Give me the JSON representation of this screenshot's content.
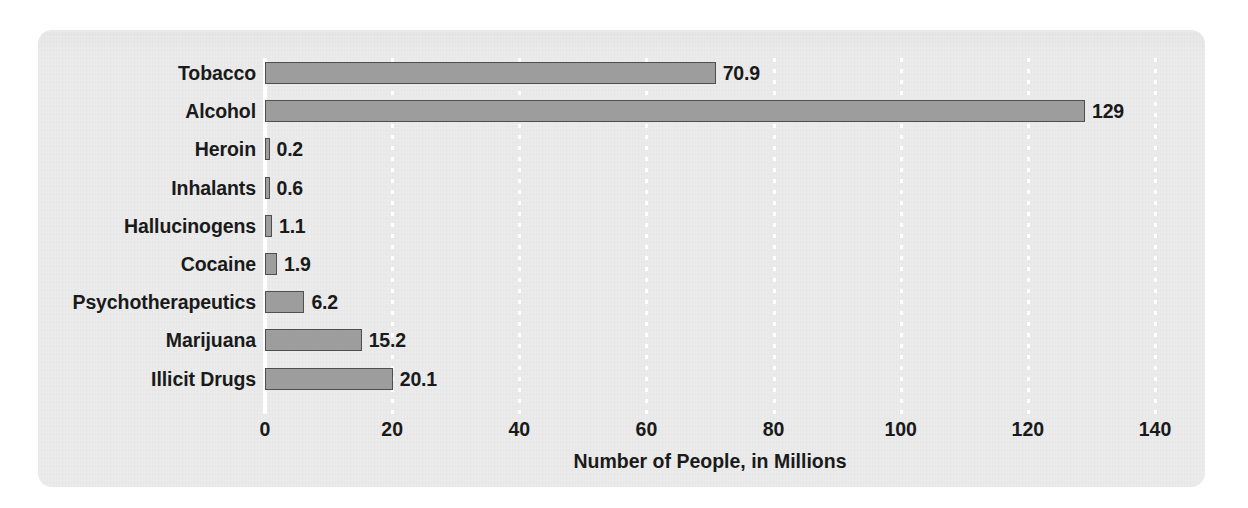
{
  "chart_data": {
    "type": "bar",
    "orientation": "horizontal",
    "title": "",
    "xlabel": "Number of People, in Millions",
    "ylabel": "",
    "xlim": [
      0,
      140
    ],
    "xticks": [
      0,
      20,
      40,
      60,
      80,
      100,
      120,
      140
    ],
    "grid": "vertical-dotted-white",
    "legend": "none",
    "categories": [
      "Tobacco",
      "Alcohol",
      "Heroin",
      "Inhalants",
      "Hallucinogens",
      "Cocaine",
      "Psychotherapeutics",
      "Marijuana",
      "Illicit Drugs"
    ],
    "values": [
      70.9,
      129,
      0.2,
      0.6,
      1.1,
      1.9,
      6.2,
      15.2,
      20.1
    ],
    "value_labels": [
      "70.9",
      "129",
      "0.2",
      "0.6",
      "1.1",
      "1.9",
      "6.2",
      "15.2",
      "20.1"
    ],
    "colors": {
      "bar_fill": "#9d9d9d",
      "bar_border": "#4f4f4f",
      "panel_background": "#ebebeb",
      "gridline": "#ffffff",
      "text": "#1a1a1a"
    }
  }
}
